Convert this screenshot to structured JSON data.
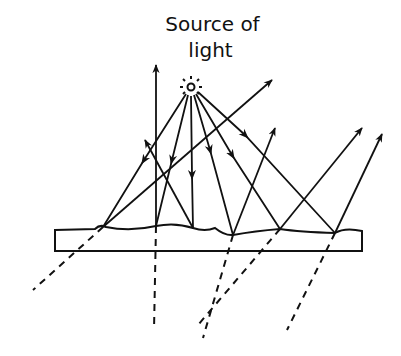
{
  "diagram": {
    "title_line1": "Source of",
    "title_line2": "light",
    "colors": {
      "ink": "#111111",
      "background": "#ffffff"
    },
    "source": {
      "x": 191,
      "y": 87
    },
    "surface": {
      "label": "rough surface (diffuse reflection)"
    },
    "incident_rays": [
      {
        "from": "source",
        "to": [
          103,
          227
        ]
      },
      {
        "from": "source",
        "to": [
          156,
          226
        ]
      },
      {
        "from": "source",
        "to": [
          193,
          228
        ]
      },
      {
        "from": "source",
        "to": [
          233,
          235
        ]
      },
      {
        "from": "source",
        "to": [
          280,
          229
        ]
      },
      {
        "from": "source",
        "to": [
          335,
          233
        ]
      }
    ],
    "reflected_rays": [
      {
        "from": [
          103,
          227
        ],
        "to": [
          272,
          80
        ]
      },
      {
        "from": [
          156,
          226
        ],
        "to": [
          156,
          65
        ]
      },
      {
        "from": [
          193,
          228
        ],
        "to": [
          145,
          140
        ]
      },
      {
        "from": [
          233,
          235
        ],
        "to": [
          275,
          128
        ]
      },
      {
        "from": [
          280,
          229
        ],
        "to": [
          362,
          128
        ]
      },
      {
        "from": [
          335,
          233
        ],
        "to": [
          382,
          134
        ]
      }
    ],
    "refracted_rays_dashed": [
      {
        "from": [
          103,
          227
        ],
        "to": [
          33,
          290
        ]
      },
      {
        "from": [
          156,
          226
        ],
        "to": [
          154,
          330
        ]
      },
      {
        "from": [
          233,
          235
        ],
        "to": [
          203,
          338
        ]
      },
      {
        "from": [
          280,
          229
        ],
        "to": [
          198,
          325
        ]
      },
      {
        "from": [
          335,
          233
        ],
        "to": [
          287,
          330
        ]
      }
    ]
  }
}
